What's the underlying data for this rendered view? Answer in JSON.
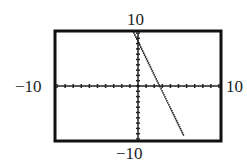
{
  "chart_data": {
    "type": "line",
    "title": "",
    "xlabel": "",
    "ylabel": "",
    "xlim": [
      -10,
      10
    ],
    "ylim": [
      -10,
      10
    ],
    "x_tick_spacing": 1,
    "y_tick_spacing": 1,
    "grid": false,
    "window_labels": {
      "xmin": "−10",
      "xmax": "10",
      "ymin": "−10",
      "ymax": "10"
    },
    "series": [
      {
        "name": "line",
        "style": "dotted",
        "x": [
          -0.5,
          0,
          2.5,
          5.6
        ],
        "y": [
          10,
          10,
          0,
          -9.2
        ]
      }
    ]
  }
}
